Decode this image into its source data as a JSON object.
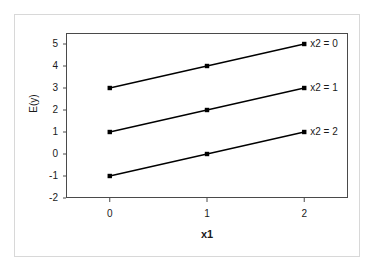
{
  "chart_data": {
    "type": "line",
    "title": "",
    "subtitle": "",
    "xlabel": "x1",
    "ylabel": "E(y)",
    "x": [
      0,
      1,
      2
    ],
    "xtick_labels": [
      "0",
      "1",
      "2"
    ],
    "ytick_labels": [
      "5",
      "4",
      "3",
      "2",
      "1",
      "0",
      "-1",
      "-2"
    ],
    "ytick_values": [
      5,
      4,
      3,
      2,
      1,
      0,
      -1,
      -2
    ],
    "xlim": [
      -0.45,
      2.45
    ],
    "ylim": [
      -2,
      5.5
    ],
    "grid": false,
    "legend_position": "inline-right-of-last-point",
    "marker": "square",
    "line_color": "#000000",
    "marker_color": "#000000",
    "series": [
      {
        "name": "x2 = 0",
        "values": [
          3,
          4,
          5
        ]
      },
      {
        "name": "x2 = 1",
        "values": [
          1,
          2,
          3
        ]
      },
      {
        "name": "x2 = 2",
        "values": [
          -1,
          0,
          1
        ]
      }
    ],
    "annotations": [
      {
        "text": "x2 = 0",
        "at_x": 2,
        "at_y": 5
      },
      {
        "text": "x2 = 1",
        "at_x": 2,
        "at_y": 3
      },
      {
        "text": "x2 = 2",
        "at_x": 2,
        "at_y": 1
      }
    ]
  },
  "colors": {
    "plot_border": "#4a4a4a",
    "outer_frame": "#d8d8d8",
    "background": "#ffffff",
    "text": "#1a1a1a"
  }
}
